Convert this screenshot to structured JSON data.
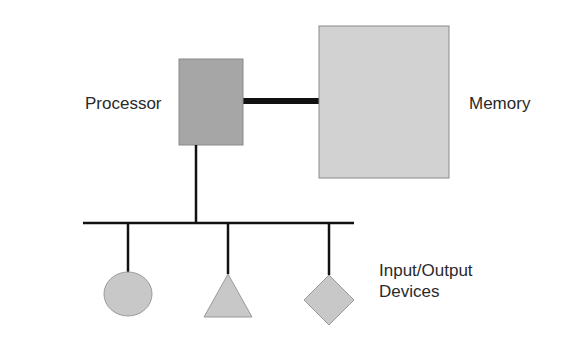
{
  "labels": {
    "processor": "Processor",
    "memory": "Memory",
    "io_line1": "Input/Output",
    "io_line2": "Devices"
  },
  "colors": {
    "processor_fill": "#a6a6a6",
    "memory_fill": "#d2d2d2",
    "device_fill": "#c8c8c8",
    "line": "#111111"
  },
  "devices": [
    {
      "shape": "circle"
    },
    {
      "shape": "triangle"
    },
    {
      "shape": "diamond"
    }
  ]
}
